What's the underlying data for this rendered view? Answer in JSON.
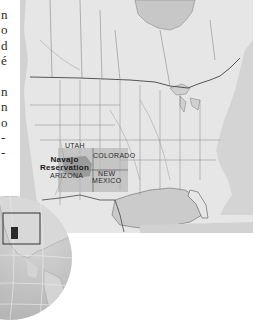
{
  "margin_text": {
    "fragments": [
      {
        "text": "n",
        "top": 8
      },
      {
        "text": "o",
        "top": 23
      },
      {
        "text": "d",
        "top": 39
      },
      {
        "text": "é",
        "top": 54
      },
      {
        "text": "n",
        "top": 85
      },
      {
        "text": "n",
        "top": 100
      },
      {
        "text": "o",
        "top": 116
      },
      {
        "text": "-",
        "top": 131
      },
      {
        "text": "-",
        "top": 146
      }
    ]
  },
  "map": {
    "title": "North America locator map",
    "labels": {
      "utah": "UTAH",
      "colorado": "COLORADO",
      "navajo_line1": "Navajo",
      "navajo_line2": "Reservation",
      "arizona": "ARIZONA",
      "new_mexico_line1": "NEW",
      "new_mexico_line2": "MEXICO"
    },
    "colors": {
      "land": "#e4e4e4",
      "water": "#c9c9c9",
      "borders": "#555555",
      "highlight": "#b0b0b0",
      "reservation": "#8c8c8c"
    }
  },
  "globe": {
    "inset_label": "Globe inset showing region",
    "colors": {
      "ocean": "#bdbdbd",
      "land": "#d6d6d6",
      "marker": "#2a2a2a"
    }
  }
}
